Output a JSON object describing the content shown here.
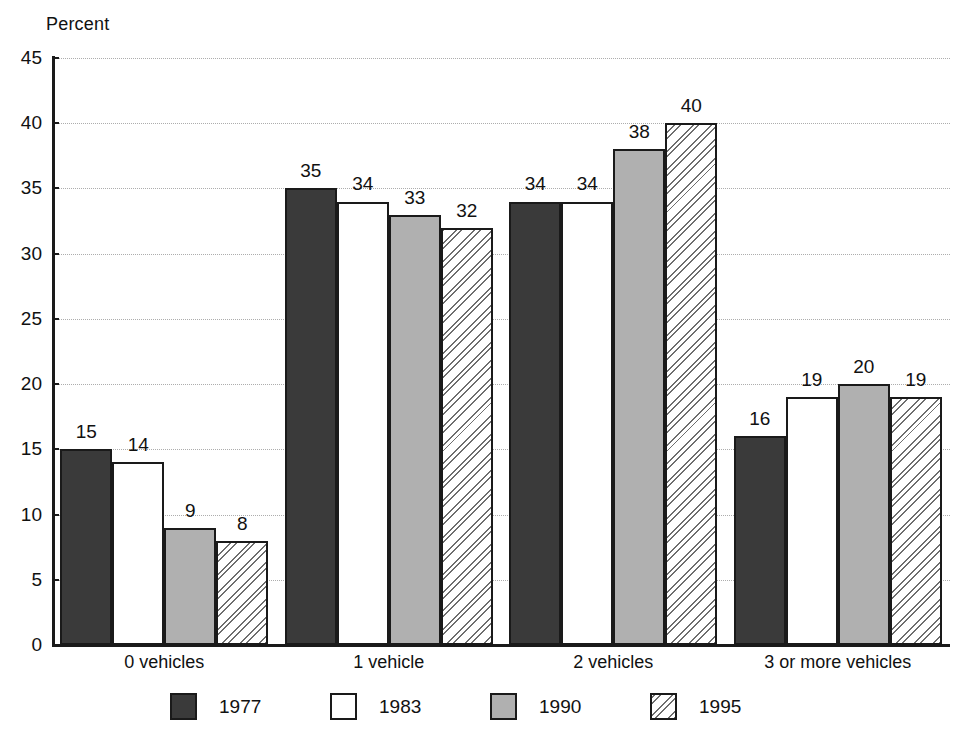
{
  "chart_data": {
    "type": "bar",
    "title": "",
    "subtitle": "",
    "ylabel": "Percent",
    "xlabel": "",
    "ylim": [
      0,
      45
    ],
    "yticks": [
      0,
      5,
      10,
      15,
      20,
      25,
      30,
      35,
      40,
      45
    ],
    "grid": true,
    "legend_position": "bottom",
    "categories": [
      "0 vehicles",
      "1 vehicle",
      "2 vehicles",
      "3 or more vehicles"
    ],
    "series": [
      {
        "name": "1977",
        "style": "dark-gray-fill",
        "color": "#3a3a3a",
        "values": [
          15,
          35,
          34,
          16
        ]
      },
      {
        "name": "1983",
        "style": "white-fill",
        "color": "#ffffff",
        "values": [
          14,
          34,
          34,
          19
        ]
      },
      {
        "name": "1990",
        "style": "light-gray-fill",
        "color": "#b0b0b0",
        "values": [
          9,
          33,
          38,
          20
        ]
      },
      {
        "name": "1995",
        "style": "diagonal-hatch",
        "color": "#ffffff",
        "values": [
          8,
          32,
          40,
          19
        ]
      }
    ]
  },
  "axis": {
    "y_title": "Percent",
    "tick_labels": [
      "45",
      "40",
      "35",
      "30",
      "25",
      "20",
      "15",
      "10",
      "5",
      "0"
    ]
  },
  "category_labels": [
    "0 vehicles",
    "1 vehicle",
    "2 vehicles",
    "3 or more vehicles"
  ],
  "legend": {
    "items": [
      {
        "label": "1977",
        "swatch": "dark-gray-swatch"
      },
      {
        "label": "1983",
        "swatch": "white-swatch"
      },
      {
        "label": "1990",
        "swatch": "light-gray-swatch"
      },
      {
        "label": "1995",
        "swatch": "hatch-swatch"
      }
    ]
  },
  "bar_values_flat": {
    "g0": [
      "15",
      "14",
      "9",
      "8"
    ],
    "g1": [
      "35",
      "34",
      "33",
      "32"
    ],
    "g2": [
      "34",
      "34",
      "38",
      "40"
    ],
    "g3": [
      "16",
      "19",
      "20",
      "19"
    ]
  },
  "colors": {
    "axis": "#1a1a1a",
    "gridline": "#adadad",
    "dark": "#3a3a3a",
    "gray": "#b0b0b0",
    "white": "#ffffff",
    "text": "#111111"
  }
}
